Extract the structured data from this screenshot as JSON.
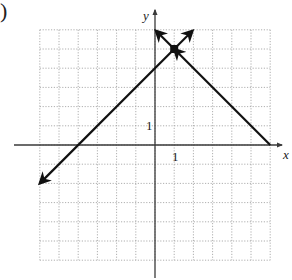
{
  "figure": {
    "part_label": ")",
    "x_axis_label": "x",
    "y_axis_label": "y",
    "x_tick_label": "1",
    "y_tick_label": "1"
  },
  "colors": {
    "grid": "#9a9a9a",
    "axis": "#3a3a3a",
    "line": "#111111",
    "background": "#ffffff"
  },
  "chart_data": {
    "type": "line",
    "title": "",
    "xlabel": "x",
    "ylabel": "y",
    "xlim": [
      -6,
      6
    ],
    "ylim": [
      -6,
      6
    ],
    "grid": true,
    "grid_style": "dotted",
    "legend": null,
    "vertex": {
      "x": 1,
      "y": 5
    },
    "series": [
      {
        "name": "left branch",
        "x": [
          -6,
          1
        ],
        "y": [
          -2,
          5
        ],
        "arrow_end": true
      },
      {
        "name": "right branch",
        "x": [
          1,
          6
        ],
        "y": [
          5,
          0
        ],
        "arrow_end": true
      },
      {
        "name": "vertex arrow upper-left",
        "x": [
          1,
          0
        ],
        "y": [
          5,
          6
        ],
        "arrow_end": true
      },
      {
        "name": "vertex arrow upper-right",
        "x": [
          1,
          2
        ],
        "y": [
          5,
          6
        ],
        "arrow_end": true
      }
    ],
    "annotations": [
      {
        "text": "1",
        "x": 1,
        "y": 0,
        "position": "below x-axis"
      },
      {
        "text": "1",
        "x": 0,
        "y": 1,
        "position": "left of y-axis"
      }
    ]
  }
}
